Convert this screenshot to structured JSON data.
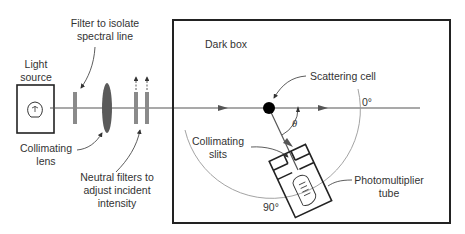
{
  "diagram": {
    "type": "light-scattering-apparatus",
    "labels": {
      "light_source": [
        "Light",
        "source"
      ],
      "filter": [
        "Filter to isolate",
        "spectral line"
      ],
      "collimating_lens": [
        "Collimating",
        "lens"
      ],
      "neutral_filters": [
        "Neutral filters to",
        "adjust incident",
        "intensity"
      ],
      "dark_box": "Dark box",
      "scattering_cell": "Scattering cell",
      "collimating_slits": [
        "Collimating",
        "slits"
      ],
      "photomultiplier": [
        "Photomultiplier",
        "tube"
      ],
      "angle_0": "0°",
      "angle_90": "90°",
      "theta": "θ"
    },
    "colors": {
      "line": "#222222",
      "beam": "#555555",
      "filter": "#8a8a8a",
      "lens": "#5a5a5a",
      "arc": "#999999",
      "cell": "#000000"
    }
  }
}
